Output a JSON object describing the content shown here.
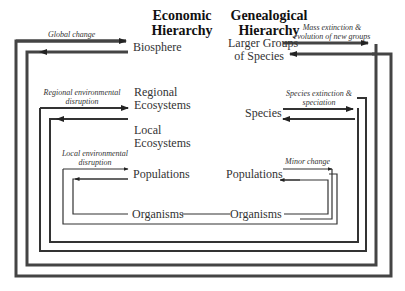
{
  "headers": {
    "economic": [
      "Economic",
      "Hierarchy"
    ],
    "genealogical": [
      "Genealogical",
      "Hierarchy"
    ]
  },
  "economic_levels": {
    "biosphere": "Biosphere",
    "regional_ecosystems": [
      "Regional",
      "Ecosystems"
    ],
    "local_ecosystems": [
      "Local",
      "Ecosystems"
    ],
    "populations": "Populations",
    "organisms": "Organisms"
  },
  "genealogical_levels": {
    "larger_groups": [
      "Larger Groups",
      "of Species"
    ],
    "species": "Species",
    "populations": "Populations",
    "organisms": "Organisms"
  },
  "annotations": {
    "global_change": "Global change",
    "mass_extinction": [
      "Mass extinction &",
      "evolution of new groups"
    ],
    "regional_disruption": [
      "Regional environmental",
      "disruption"
    ],
    "species_extinction": [
      "Species extinction &",
      "speciation"
    ],
    "local_disruption": [
      "Local environmental",
      "disruption"
    ],
    "minor_change": "Minor change"
  },
  "colors": {
    "line": "#333333",
    "text": "#222222",
    "background": "#ffffff"
  }
}
